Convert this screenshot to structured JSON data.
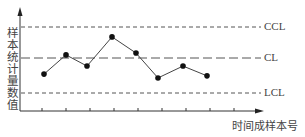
{
  "chart": {
    "y_axis_label": "样本统计量数值",
    "x_axis_label": "时间成样本号",
    "limit_lines": [
      {
        "label": "CCL",
        "style": "short-dash"
      },
      {
        "label": "CL",
        "style": "long-dash"
      },
      {
        "label": "LCL",
        "style": "short-dash"
      }
    ]
  },
  "chart_data": {
    "type": "line",
    "title": "",
    "xlabel": "时间成样本号",
    "ylabel": "样本统计量数值",
    "x": [
      1,
      2,
      3,
      4,
      5,
      6,
      7,
      8
    ],
    "series": [
      {
        "name": "sample statistic",
        "values": [
          -0.46,
          0.1,
          -0.23,
          0.68,
          0.16,
          -0.57,
          -0.23,
          -0.51
        ],
        "marker": "filled-circle"
      }
    ],
    "reference_lines": [
      {
        "label": "CCL",
        "value": 1.0
      },
      {
        "label": "CL",
        "value": 0.0
      },
      {
        "label": "LCL",
        "value": -1.0
      }
    ],
    "x_ticks": 9,
    "ylim": [
      -1.5,
      1.6
    ],
    "grid": false,
    "legend": "none"
  }
}
